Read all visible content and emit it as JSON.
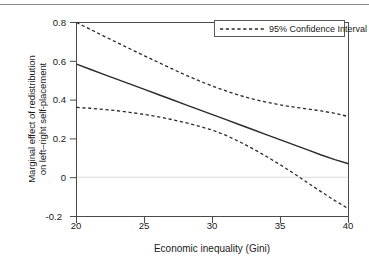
{
  "chart_data": {
    "type": "line",
    "title": "",
    "xlabel": "Economic inequality (Gini)",
    "ylabel": "Marginal effect of redistribution\non left–right self-placement",
    "xlim": [
      20,
      40
    ],
    "ylim": [
      -0.2,
      0.8
    ],
    "xticks": [
      20,
      25,
      30,
      35,
      40
    ],
    "xtick_labels": [
      "20",
      "25",
      "30",
      "35",
      "40"
    ],
    "yticks": [
      -0.2,
      0,
      0.2,
      0.4,
      0.6,
      0.8
    ],
    "ytick_labels": [
      "-0.2",
      "0",
      "0.2",
      "0.4",
      "0.6",
      "0.8"
    ],
    "grid": false,
    "zero_line": true,
    "legend_position": "top-right",
    "x": [
      20,
      21,
      22,
      23,
      24,
      25,
      26,
      27,
      28,
      29,
      30,
      31,
      32,
      33,
      34,
      35,
      36,
      37,
      38,
      39,
      40
    ],
    "series": [
      {
        "name": "Marginal effect",
        "style": "solid",
        "color": "#2b2b2b",
        "values": [
          0.585,
          0.559,
          0.533,
          0.507,
          0.481,
          0.455,
          0.429,
          0.403,
          0.377,
          0.351,
          0.325,
          0.299,
          0.273,
          0.247,
          0.221,
          0.195,
          0.169,
          0.143,
          0.117,
          0.093,
          0.072
        ]
      },
      {
        "name": "95% Confidence Interval upper",
        "style": "dashed",
        "color": "#2b2b2b",
        "values": [
          0.8,
          0.765,
          0.73,
          0.696,
          0.662,
          0.628,
          0.595,
          0.562,
          0.53,
          0.5,
          0.472,
          0.447,
          0.424,
          0.405,
          0.389,
          0.375,
          0.364,
          0.354,
          0.344,
          0.332,
          0.315
        ]
      },
      {
        "name": "95% Confidence Interval lower",
        "style": "dashed",
        "color": "#2b2b2b",
        "values": [
          0.362,
          0.358,
          0.352,
          0.345,
          0.336,
          0.326,
          0.314,
          0.3,
          0.284,
          0.266,
          0.245,
          0.218,
          0.185,
          0.148,
          0.108,
          0.066,
          0.021,
          -0.026,
          -0.073,
          -0.118,
          -0.16
        ]
      }
    ]
  },
  "legend": {
    "entries": [
      {
        "label": "95% Confidence Interval",
        "style": "dashed"
      }
    ]
  }
}
